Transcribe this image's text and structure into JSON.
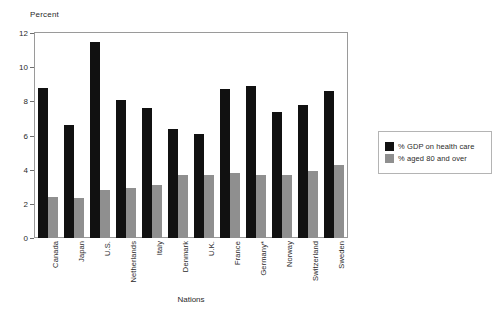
{
  "chart_data": {
    "type": "bar",
    "title": "",
    "xlabel": "Nations",
    "ylabel": "Percent",
    "ylim": [
      0,
      12
    ],
    "yticks": [
      0,
      2,
      4,
      6,
      8,
      10,
      12
    ],
    "grid": false,
    "legend_position": "right",
    "categories": [
      "Canada",
      "Japan",
      "U.S.",
      "Netherlands",
      "Italy",
      "Denmark",
      "U.K.",
      "France",
      "Germany*",
      "Norway",
      "Switzerland",
      "Sweden"
    ],
    "series": [
      {
        "name": "% GDP on health care",
        "color": "#111111",
        "values": [
          8.8,
          6.6,
          11.5,
          8.1,
          7.6,
          6.4,
          6.1,
          8.7,
          8.9,
          7.4,
          7.8,
          8.6
        ]
      },
      {
        "name": "% aged 80 and over",
        "color": "#8f8f8f",
        "values": [
          2.4,
          2.35,
          2.8,
          2.95,
          3.1,
          3.7,
          3.7,
          3.8,
          3.7,
          3.7,
          3.95,
          4.3
        ]
      }
    ]
  },
  "legend": {
    "items": [
      {
        "label": "% GDP on health care",
        "color": "#111111"
      },
      {
        "label": "% aged 80 and over",
        "color": "#8f8f8f"
      }
    ]
  }
}
